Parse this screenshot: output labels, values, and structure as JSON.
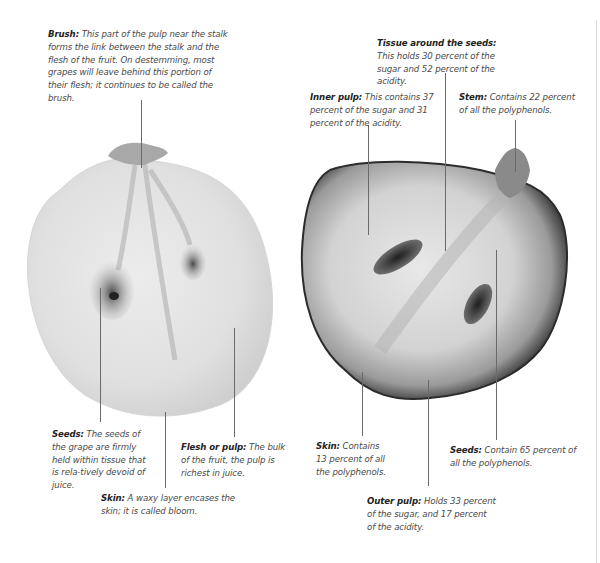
{
  "figure": {
    "left_grape": {
      "name": "white grape cross-section",
      "annotations": {
        "brush": {
          "term": "Brush:",
          "text": "This part of the pulp near the stalk forms the link between the stalk and the flesh of the fruit. On destemming, most grapes will leave behind this portion of their flesh; it continues to be called the brush."
        },
        "seeds": {
          "term": "Seeds:",
          "text": "The seeds of the grape are firmly held within tissue that is rela-tively devoid of juice."
        },
        "flesh": {
          "term": "Flesh or pulp:",
          "text": "The bulk of the fruit, the pulp is richest in juice."
        },
        "skin": {
          "term": "Skin:",
          "text": "A waxy layer encases the skin; it is called bloom."
        }
      }
    },
    "right_grape": {
      "name": "red grape cross-section",
      "annotations": {
        "tissue": {
          "term": "Tissue around the seeds:",
          "text": "This holds 30 percent of the sugar and 52 percent of the acidity."
        },
        "inner_pulp": {
          "term": "Inner pulp:",
          "text": "This contains 37 percent of the sugar and 31 percent of the acidity."
        },
        "stem": {
          "term": "Stem:",
          "text": "Contains 22 percent of all the polyphenols."
        },
        "skin": {
          "term": "Skin:",
          "text": "Contains 13 percent of all the polyphenols."
        },
        "seeds": {
          "term": "Seeds:",
          "text": "Contain 65 percent of all the polyphenols."
        },
        "outer_pulp": {
          "term": "Outer pulp:",
          "text": "Holds 33 percent of the sugar, and 17 percent of the acidity."
        }
      }
    },
    "composition": {
      "sugar_percent": {
        "inner_pulp": 37,
        "tissue_around_seeds": 30,
        "outer_pulp": 33
      },
      "acidity_percent": {
        "inner_pulp": 31,
        "tissue_around_seeds": 52,
        "outer_pulp": 17
      },
      "polyphenols_percent": {
        "seeds": 65,
        "stem": 22,
        "skin": 13
      }
    }
  }
}
